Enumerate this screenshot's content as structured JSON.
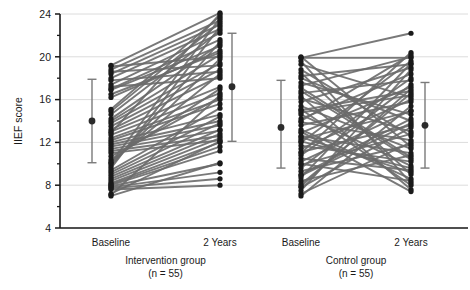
{
  "chart_data": {
    "type": "line",
    "title": "",
    "xlabel": "",
    "ylabel": "IIEF score",
    "ylim": [
      4,
      24
    ],
    "yticks": [
      4,
      8,
      12,
      16,
      20,
      24
    ],
    "ytick_labels": [
      "4",
      "8",
      "12",
      "16",
      "20",
      "24"
    ],
    "yminor_ticks": [
      6,
      10,
      14,
      18,
      22
    ],
    "grid": "horizontal-major-only",
    "legend": "none",
    "xcategories": [
      "Baseline",
      "2 Years",
      "Baseline",
      "2 Years"
    ],
    "groups": [
      {
        "name": "Intervention group",
        "n_label": "(n = 55)",
        "x_labels": [
          "Baseline",
          "2 Years"
        ],
        "pairs": [
          [
            19.2,
            24.1
          ],
          [
            18.8,
            23.4
          ],
          [
            18.4,
            23.0
          ],
          [
            18.0,
            22.6
          ],
          [
            17.4,
            22.2
          ],
          [
            17.0,
            21.6
          ],
          [
            16.9,
            21.0
          ],
          [
            16.5,
            20.4
          ],
          [
            19.1,
            20.0
          ],
          [
            18.6,
            19.2
          ],
          [
            17.8,
            18.6
          ],
          [
            17.2,
            18.0
          ],
          [
            15.1,
            23.8
          ],
          [
            14.9,
            23.2
          ],
          [
            14.6,
            22.4
          ],
          [
            14.2,
            21.2
          ],
          [
            14.0,
            20.2
          ],
          [
            13.8,
            19.4
          ],
          [
            13.5,
            18.8
          ],
          [
            13.2,
            18.2
          ],
          [
            13.0,
            17.2
          ],
          [
            12.7,
            16.6
          ],
          [
            12.4,
            16.0
          ],
          [
            12.2,
            15.6
          ],
          [
            12.0,
            14.6
          ],
          [
            11.8,
            14.0
          ],
          [
            11.6,
            13.6
          ],
          [
            11.4,
            13.1
          ],
          [
            11.2,
            12.6
          ],
          [
            11.0,
            12.2
          ],
          [
            10.7,
            16.2
          ],
          [
            10.4,
            17.0
          ],
          [
            10.2,
            18.4
          ],
          [
            10.0,
            19.8
          ],
          [
            9.8,
            21.4
          ],
          [
            9.6,
            22.8
          ],
          [
            9.4,
            15.2
          ],
          [
            9.2,
            14.4
          ],
          [
            9.0,
            13.8
          ],
          [
            8.8,
            13.2
          ],
          [
            8.6,
            12.8
          ],
          [
            8.4,
            12.4
          ],
          [
            8.2,
            12.0
          ],
          [
            8.1,
            11.6
          ],
          [
            8.0,
            11.2
          ],
          [
            7.9,
            10.0
          ],
          [
            7.8,
            9.2
          ],
          [
            7.7,
            8.6
          ],
          [
            7.6,
            8.0
          ],
          [
            7.2,
            12.1
          ],
          [
            7.1,
            16.4
          ],
          [
            7.0,
            10.1
          ],
          [
            10.1,
            23.6
          ],
          [
            12.9,
            24.0
          ],
          [
            16.2,
            20.6
          ]
        ],
        "mean_baseline": 14.0,
        "mean_2years": 17.2,
        "error_baseline": {
          "low": 10.1,
          "high": 17.9,
          "mean": 14.0
        },
        "error_2years": {
          "low": 12.1,
          "high": 22.2,
          "mean": 17.2
        }
      },
      {
        "name": "Control group",
        "n_label": "(n = 55)",
        "x_labels": [
          "Baseline",
          "2 Years"
        ],
        "pairs": [
          [
            19.9,
            22.2
          ],
          [
            19.9,
            19.9
          ],
          [
            19.3,
            16.2
          ],
          [
            18.8,
            12.6
          ],
          [
            18.2,
            19.3
          ],
          [
            17.6,
            14.6
          ],
          [
            17.1,
            10.6
          ],
          [
            16.6,
            17.8
          ],
          [
            16.1,
            13.0
          ],
          [
            15.8,
            19.0
          ],
          [
            15.4,
            11.4
          ],
          [
            15.0,
            16.8
          ],
          [
            14.6,
            9.8
          ],
          [
            14.2,
            18.4
          ],
          [
            13.9,
            12.2
          ],
          [
            13.6,
            15.8
          ],
          [
            13.2,
            8.6
          ],
          [
            12.9,
            17.2
          ],
          [
            12.6,
            11.0
          ],
          [
            12.3,
            14.9
          ],
          [
            12.0,
            19.6
          ],
          [
            11.7,
            10.2
          ],
          [
            11.4,
            16.0
          ],
          [
            11.1,
            13.6
          ],
          [
            10.8,
            18.0
          ],
          [
            10.5,
            9.4
          ],
          [
            10.2,
            15.0
          ],
          [
            9.9,
            12.8
          ],
          [
            9.6,
            17.4
          ],
          [
            9.3,
            11.8
          ],
          [
            9.0,
            14.2
          ],
          [
            8.7,
            19.4
          ],
          [
            8.4,
            10.8
          ],
          [
            8.1,
            16.6
          ],
          [
            7.8,
            13.4
          ],
          [
            7.5,
            18.8
          ],
          [
            7.2,
            12.0
          ],
          [
            7.0,
            15.4
          ],
          [
            19.6,
            8.2
          ],
          [
            18.5,
            9.0
          ],
          [
            17.3,
            20.0
          ],
          [
            16.3,
            7.6
          ],
          [
            15.1,
            8.0
          ],
          [
            14.0,
            20.2
          ],
          [
            13.0,
            7.4
          ],
          [
            12.1,
            9.6
          ],
          [
            11.0,
            20.4
          ],
          [
            10.0,
            8.4
          ],
          [
            8.9,
            13.8
          ],
          [
            7.9,
            17.0
          ],
          [
            20.0,
            11.6
          ],
          [
            18.0,
            14.0
          ],
          [
            16.8,
            10.4
          ],
          [
            14.8,
            16.4
          ],
          [
            12.5,
            9.2
          ]
        ],
        "mean_baseline": 13.4,
        "mean_2years": 13.6,
        "error_baseline": {
          "low": 9.6,
          "high": 17.8,
          "mean": 13.4
        },
        "error_2years": {
          "low": 9.6,
          "high": 17.6,
          "mean": 13.6
        }
      }
    ],
    "colors": {
      "line": "#6b6b6b",
      "marker": "#1a1a1a",
      "error_bar": "#7a7a7a",
      "grid": "#dcdcdc",
      "axis": "#1a1a1a"
    }
  },
  "axis": {
    "y_title": "IIEF score"
  }
}
